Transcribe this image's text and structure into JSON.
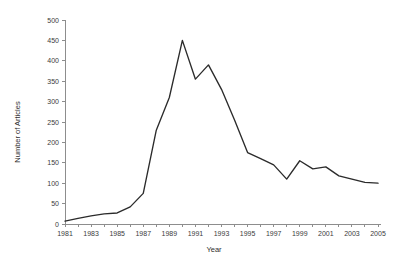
{
  "chart_data": {
    "type": "line",
    "title": "",
    "xlabel": "Year",
    "ylabel": "Number of Articles",
    "xlim": [
      1981,
      2005
    ],
    "ylim": [
      0,
      500
    ],
    "grid": false,
    "legend": null,
    "y_ticks": [
      0,
      50,
      100,
      150,
      200,
      250,
      300,
      350,
      400,
      450,
      500
    ],
    "y_tick_labels": [
      "0",
      "50",
      "100",
      "150",
      "200",
      "250",
      "300",
      "350",
      "400",
      "450",
      "500"
    ],
    "x_ticks": [
      1981,
      1982,
      1983,
      1984,
      1985,
      1986,
      1987,
      1988,
      1989,
      1990,
      1991,
      1992,
      1993,
      1994,
      1995,
      1996,
      1997,
      1998,
      1999,
      2000,
      2001,
      2002,
      2003,
      2004,
      2005
    ],
    "x_tick_labels": [
      "1981",
      "",
      "1983",
      "",
      "1985",
      "",
      "1987",
      "",
      "1989",
      "",
      "1991",
      "",
      "1993",
      "",
      "1995",
      "",
      "1997",
      "",
      "1999",
      "",
      "2001",
      "",
      "2003",
      "",
      "2005"
    ],
    "x_labeled_ticks": [
      1981,
      1983,
      1985,
      1987,
      1989,
      1991,
      1993,
      1995,
      1997,
      1999,
      2001,
      2003,
      2005
    ],
    "series": [
      {
        "name": "Number of Articles",
        "color": "#2b2b2b",
        "x": [
          1981,
          1982,
          1983,
          1984,
          1985,
          1986,
          1987,
          1988,
          1989,
          1990,
          1991,
          1992,
          1993,
          1994,
          1995,
          1996,
          1997,
          1998,
          1999,
          2000,
          2001,
          2002,
          2003,
          2004,
          2005
        ],
        "values": [
          7,
          14,
          20,
          25,
          27,
          42,
          75,
          230,
          310,
          450,
          355,
          390,
          330,
          255,
          175,
          160,
          145,
          110,
          155,
          135,
          140,
          118,
          110,
          102,
          100
        ]
      }
    ],
    "axis_color": "#8d8d8d",
    "text_color": "#3b3b3b",
    "background": "#ffffff"
  }
}
